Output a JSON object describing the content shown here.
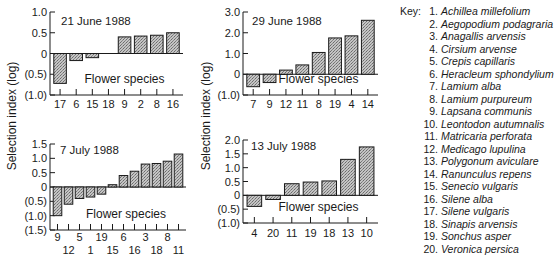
{
  "figure": {
    "ylabel": "Selection index (log)",
    "xlabel": "Flower species",
    "key_title": "Key:"
  },
  "key": [
    {
      "n": "1.",
      "name": "Achillea millefolium"
    },
    {
      "n": "2.",
      "name": "Aegopodium podagraria"
    },
    {
      "n": "3.",
      "name": "Anagallis arvensis"
    },
    {
      "n": "4.",
      "name": "Cirsium arvense"
    },
    {
      "n": "5.",
      "name": "Crepis capillaris"
    },
    {
      "n": "6.",
      "name": "Heracleum sphondylium"
    },
    {
      "n": "7.",
      "name": "Lamium alba"
    },
    {
      "n": "8.",
      "name": "Lamium purpureum"
    },
    {
      "n": "9.",
      "name": "Lapsana communis"
    },
    {
      "n": "10.",
      "name": "Leontodon autumnalis"
    },
    {
      "n": "11.",
      "name": "Matricaria perforata"
    },
    {
      "n": "12.",
      "name": "Medicago lupulina"
    },
    {
      "n": "13.",
      "name": "Polygonum aviculare"
    },
    {
      "n": "14.",
      "name": "Ranunculus repens"
    },
    {
      "n": "15.",
      "name": "Senecio vulgaris"
    },
    {
      "n": "16.",
      "name": "Silene alba"
    },
    {
      "n": "17.",
      "name": "Silene vulgaris"
    },
    {
      "n": "18.",
      "name": "Sinapis arvensis"
    },
    {
      "n": "19.",
      "name": "Sonchus asper"
    },
    {
      "n": "20.",
      "name": "Veronica persica"
    }
  ],
  "colors": {
    "bar_fill": "#b8b8b8",
    "bar_stroke": "#1a1a1a",
    "axis": "#1a1a1a"
  },
  "chart_data": [
    {
      "type": "bar",
      "title": "21 June 1988",
      "xlabel": "Flower species",
      "ylabel": "Selection index (log)",
      "categories": [
        "17",
        "6",
        "15",
        "18",
        "9",
        "2",
        "8",
        "16"
      ],
      "values": [
        -0.72,
        -0.17,
        -0.1,
        0.0,
        0.4,
        0.42,
        0.44,
        0.5
      ],
      "yticks": [
        1.0,
        0.5,
        0,
        -0.5,
        -1.0
      ],
      "ytick_labels": [
        "1.0",
        "0.5",
        "0",
        "(0.5)",
        "(1.0)"
      ],
      "ylim": [
        -1.0,
        1.0
      ],
      "grid": false
    },
    {
      "type": "bar",
      "title": "29 June 1988",
      "xlabel": "Flower species",
      "ylabel": "Selection index (log)",
      "categories": [
        "7",
        "9",
        "12",
        "11",
        "8",
        "19",
        "4",
        "14"
      ],
      "values": [
        -0.6,
        -0.4,
        0.2,
        0.45,
        1.05,
        1.75,
        1.85,
        2.6
      ],
      "yticks": [
        3.0,
        2.0,
        1.0,
        0,
        -1.0
      ],
      "ytick_labels": [
        "3.0",
        "2.0",
        "1.0",
        "0",
        "(1.0)"
      ],
      "ylim": [
        -1.0,
        3.0
      ],
      "grid": false
    },
    {
      "type": "bar",
      "title": "7 July 1988",
      "xlabel": "Flower species",
      "ylabel": "Selection index (log)",
      "categories": [
        "9",
        "12",
        "5",
        "1",
        "19",
        "15",
        "6",
        "16",
        "3",
        "18",
        "8",
        "11"
      ],
      "values": [
        -1.0,
        -0.6,
        -0.4,
        -0.35,
        -0.25,
        0.08,
        0.4,
        0.55,
        0.8,
        0.82,
        0.9,
        1.15
      ],
      "yticks": [
        1.5,
        1.0,
        0.5,
        0,
        -0.5,
        -1.0,
        -1.5
      ],
      "ytick_labels": [
        "1.5",
        "1.0",
        "0.5",
        "0",
        "(0.5)",
        "(1.0)",
        "(1.5)"
      ],
      "ylim": [
        -1.5,
        1.5
      ],
      "grid": false
    },
    {
      "type": "bar",
      "title": "13 July 1988",
      "xlabel": "Flower species",
      "ylabel": "Selection index (log)",
      "categories": [
        "4",
        "20",
        "11",
        "19",
        "18",
        "13",
        "10"
      ],
      "values": [
        -0.4,
        -0.15,
        0.42,
        0.48,
        0.52,
        1.3,
        1.75
      ],
      "yticks": [
        2.0,
        1.5,
        1.0,
        0.5,
        0,
        -0.5,
        -1.0
      ],
      "ytick_labels": [
        "2.0",
        "1.5",
        "1.0",
        "0.5",
        "0",
        "(0.5)",
        "(1.0)"
      ],
      "ylim": [
        -1.0,
        2.0
      ],
      "grid": false
    }
  ]
}
